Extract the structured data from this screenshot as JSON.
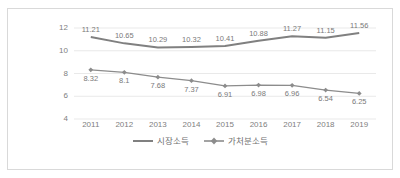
{
  "chart_data": {
    "type": "line",
    "title": "",
    "xlabel": "",
    "ylabel": "",
    "grid": true,
    "legend_position": "bottom",
    "ylim": [
      4,
      12
    ],
    "yticks": [
      4,
      6,
      8,
      10,
      12
    ],
    "categories": [
      "2011",
      "2012",
      "2013",
      "2014",
      "2015",
      "2016",
      "2017",
      "2018",
      "2019"
    ],
    "series": [
      {
        "name": "시장소득",
        "marker": "none",
        "color": "#808080",
        "values": [
          11.21,
          10.65,
          10.29,
          10.32,
          10.41,
          10.88,
          11.27,
          11.15,
          11.56
        ],
        "labels": [
          "11.21",
          "10.65",
          "10.29",
          "10.32",
          "10.41",
          "10.88",
          "11.27",
          "11.15",
          "11.56"
        ]
      },
      {
        "name": "가처분소득",
        "marker": "diamond",
        "color": "#8c8c8c",
        "values": [
          8.32,
          8.1,
          7.68,
          7.37,
          6.91,
          6.98,
          6.96,
          6.54,
          6.25
        ],
        "labels": [
          "8.32",
          "8.1",
          "7.68",
          "7.37",
          "6.91",
          "6.98",
          "6.96",
          "6.54",
          "6.25"
        ]
      }
    ]
  },
  "axis": {
    "y_tick_labels": [
      "12",
      "10",
      "8",
      "6",
      "4"
    ],
    "x_tick_labels": [
      "2011",
      "2012",
      "2013",
      "2014",
      "2015",
      "2016",
      "2017",
      "2018",
      "2019"
    ]
  },
  "legend": {
    "items": [
      {
        "label": "시장소득",
        "marker": "line"
      },
      {
        "label": "가처분소득",
        "marker": "line-diamond"
      }
    ]
  },
  "colors": {
    "series_1": "#808080",
    "series_2": "#8c8c8c",
    "grid": "#e3e3e3",
    "border": "#d9d9d9",
    "text": "#808080",
    "label_text": "#7a7a7a"
  }
}
